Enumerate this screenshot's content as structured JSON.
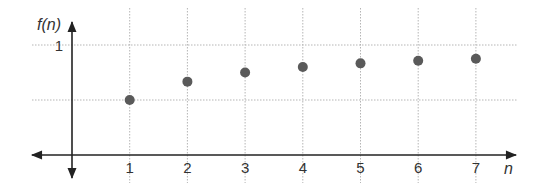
{
  "chart_data": {
    "type": "scatter",
    "title": "",
    "xlabel": "n",
    "ylabel": "f(n)",
    "x": [
      1,
      2,
      3,
      4,
      5,
      6,
      7
    ],
    "values": [
      0.5,
      0.667,
      0.75,
      0.8,
      0.833,
      0.857,
      0.875
    ],
    "series": [
      {
        "name": "f(n)",
        "x": [
          1,
          2,
          3,
          4,
          5,
          6,
          7
        ],
        "values": [
          0.5,
          0.667,
          0.75,
          0.8,
          0.833,
          0.857,
          0.875
        ]
      }
    ],
    "x_ticks": [
      "1",
      "2",
      "3",
      "4",
      "5",
      "6",
      "7"
    ],
    "y_ticks": [
      "1"
    ],
    "y_gridlines": [
      0.5,
      1
    ],
    "xlim": [
      -1,
      7.7
    ],
    "ylim": [
      0,
      1.1
    ],
    "grid": true,
    "grid_style": "dotted",
    "legend": "none",
    "colors": {
      "point": "#5a5a5a",
      "axis": "#222222",
      "grid": "#b5b5b5",
      "text": "#333333"
    }
  },
  "labels": {
    "y_axis": "f(n)",
    "x_axis": "n",
    "y_tick_1": "1",
    "x_ticks": [
      "1",
      "2",
      "3",
      "4",
      "5",
      "6",
      "7"
    ]
  }
}
